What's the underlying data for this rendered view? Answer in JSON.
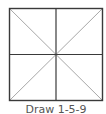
{
  "diagram": {
    "type": "grid-square-with-diagonals",
    "caption": "Draw 1-5-9",
    "square": {
      "x": 9,
      "y": 8,
      "width": 94,
      "height": 93
    },
    "colors": {
      "frame": "#3a3a3a",
      "divider": "#3a3a3a",
      "diagonal": "#a8a8a8",
      "caption": "#555555",
      "background": "#ffffff"
    }
  }
}
